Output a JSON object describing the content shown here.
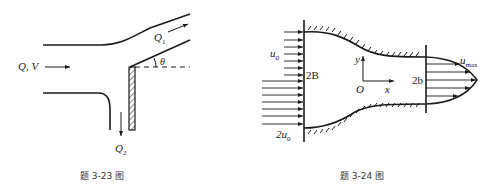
{
  "figures": [
    {
      "id": "fig-3-23",
      "caption": "题 3-23 图",
      "labels": {
        "inflow": "Q, V",
        "q1": "Q",
        "q1_sub": "1",
        "q2": "Q",
        "q2_sub": "2",
        "angle": "θ"
      }
    },
    {
      "id": "fig-3-24",
      "caption": "题 3-24 图",
      "labels": {
        "u0": "u",
        "u0_sub": "0",
        "two_u0": "2u",
        "two_u0_sub": "0",
        "inlet_width": "2B",
        "outlet_width": "2b",
        "umax": "u",
        "umax_sub": "max",
        "y_axis": "y",
        "x_axis": "x",
        "origin": "O"
      }
    }
  ]
}
